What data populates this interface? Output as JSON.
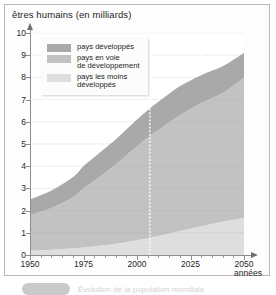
{
  "figure": {
    "title": "êtres humains (en milliards)",
    "x_axis_title": "années",
    "bottom_caption": "Évolution de la population mondiale"
  },
  "legend": {
    "items": [
      {
        "label": "pays développés",
        "color": "#a9a9a9",
        "swatch_name": "legend-swatch-developed"
      },
      {
        "label": "pays en voie\nde développement",
        "color": "#c2c2c2",
        "swatch_name": "legend-swatch-developing"
      },
      {
        "label": "pays les moins\ndéveloppés",
        "color": "#dedede",
        "swatch_name": "legend-swatch-least-developed"
      }
    ]
  },
  "axes": {
    "y_ticks": [
      "0",
      "1",
      "2",
      "3",
      "4",
      "5",
      "6",
      "7",
      "8",
      "9",
      "10"
    ],
    "x_ticks": [
      "1950",
      "1975",
      "2000",
      "2025",
      "2050"
    ]
  },
  "marker": {
    "year": 2006,
    "style": "dotted-white-vertical-line"
  },
  "chart_data": {
    "type": "area",
    "title": "êtres humains (en milliards)",
    "subtitle": "",
    "xlabel": "années",
    "ylabel": "êtres humains (en milliards)",
    "xlim": [
      1950,
      2050
    ],
    "ylim": [
      0,
      10
    ],
    "grid": true,
    "grid_axis": "y",
    "legend_position": "top-left",
    "stacked": true,
    "stack_order_bottom_to_top": [
      "pays les moins développés",
      "pays en voie de développement",
      "pays développés"
    ],
    "x": [
      1950,
      1960,
      1970,
      1975,
      1980,
      1990,
      2000,
      2006,
      2010,
      2020,
      2030,
      2040,
      2050
    ],
    "series": [
      {
        "name": "pays les moins développés",
        "color": "#dedede",
        "values": [
          0.2,
          0.24,
          0.3,
          0.34,
          0.39,
          0.51,
          0.67,
          0.78,
          0.86,
          1.08,
          1.3,
          1.5,
          1.68
        ]
      },
      {
        "name": "pays en voie de développement",
        "color": "#c2c2c2",
        "values": [
          1.6,
          1.88,
          2.3,
          2.66,
          2.95,
          3.57,
          4.23,
          4.58,
          4.77,
          5.22,
          5.55,
          5.8,
          6.32
        ]
      },
      {
        "name": "pays développés",
        "color": "#a9a9a9",
        "values": [
          0.7,
          0.78,
          0.9,
          1.0,
          1.06,
          1.12,
          1.2,
          1.24,
          1.27,
          1.3,
          1.25,
          1.2,
          1.1
        ]
      }
    ],
    "cumulative_totals": {
      "name": "population mondiale totale",
      "values": [
        2.5,
        2.9,
        3.5,
        4.0,
        4.4,
        5.2,
        6.1,
        6.6,
        6.9,
        7.6,
        8.1,
        8.5,
        9.1
      ]
    },
    "annotations": [
      {
        "type": "vline",
        "x": 2006,
        "style": "dotted",
        "color": "#ffffff"
      }
    ]
  }
}
